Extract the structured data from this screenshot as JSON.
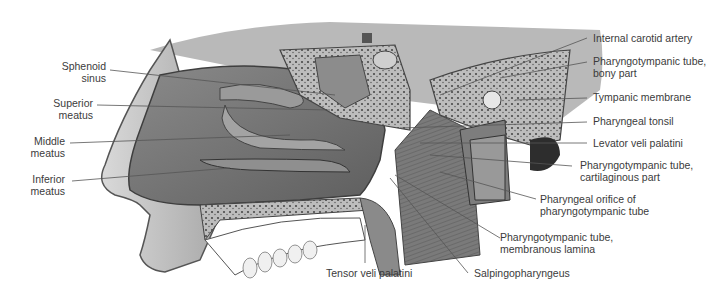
{
  "figure": {
    "colors": {
      "background": "#ffffff",
      "label_text": "#3b3b3b",
      "leader_line": "#555555"
    }
  },
  "labels_left": [
    {
      "id": "sphenoid-sinus",
      "lines": [
        "Sphenoid",
        "sinus"
      ]
    },
    {
      "id": "superior-meatus",
      "lines": [
        "Superior",
        "meatus"
      ]
    },
    {
      "id": "middle-meatus",
      "lines": [
        "Middle",
        "meatus"
      ]
    },
    {
      "id": "inferior-meatus",
      "lines": [
        "Inferior",
        "meatus"
      ]
    }
  ],
  "labels_right": [
    {
      "id": "internal-carotid-artery",
      "lines": [
        "Internal carotid artery"
      ]
    },
    {
      "id": "pharyngotympanic-tube-bony",
      "lines": [
        "Pharyngotympanic tube,",
        "bony part"
      ]
    },
    {
      "id": "tympanic-membrane",
      "lines": [
        "Tympanic membrane"
      ]
    },
    {
      "id": "pharyngeal-tonsil",
      "lines": [
        "Pharyngeal tonsil"
      ]
    },
    {
      "id": "levator-veli-palatini",
      "lines": [
        "Levator veli palatini"
      ]
    },
    {
      "id": "pharyngotympanic-tube-cartilaginous",
      "lines": [
        "Pharyngotympanic tube,",
        "cartilaginous part"
      ]
    },
    {
      "id": "pharyngeal-orifice",
      "lines": [
        "Pharyngeal orifice of",
        "pharyngotympanic tube"
      ]
    },
    {
      "id": "pharyngotympanic-tube-membranous",
      "lines": [
        "Pharyngotympanic tube,",
        "membranous lamina"
      ]
    },
    {
      "id": "salpingopharyngeus",
      "lines": [
        "Salpingopharyngeus"
      ]
    }
  ],
  "labels_bottom": [
    {
      "id": "tensor-veli-palatini",
      "lines": [
        "Tensor veli palatini"
      ]
    }
  ]
}
